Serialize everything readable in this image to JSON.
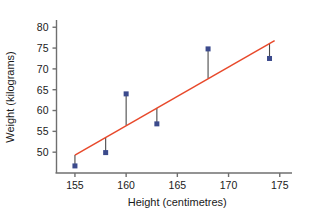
{
  "chart_data": {
    "type": "scatter",
    "title": "",
    "xlabel": "Height (centimetres)",
    "ylabel": "Weight (kilograms)",
    "xlim": [
      153.2,
      176.0
    ],
    "ylim": [
      45.0,
      81.5
    ],
    "xticks": [
      155,
      160,
      165,
      170,
      175
    ],
    "yticks": [
      50,
      55,
      60,
      65,
      70,
      75,
      80
    ],
    "xticklabels": [
      "155",
      "160",
      "165",
      "170",
      "175"
    ],
    "yticklabels": [
      "50",
      "55",
      "60",
      "65",
      "70",
      "75",
      "80"
    ],
    "grid": false,
    "legend": false,
    "point_color": "#3b4a8c",
    "line_color": "#e8492b",
    "residual_color": "#4a4a4a",
    "axis_color": "#6f6f6f",
    "series": [
      {
        "name": "Observations",
        "marker": "square",
        "x": [
          155,
          158,
          160,
          163,
          168,
          174
        ],
        "y": [
          46.7,
          49.9,
          64.0,
          56.8,
          74.8,
          72.5
        ]
      }
    ],
    "trend_line": {
      "name": "Least squares regression line",
      "x": [
        155,
        174.5
      ],
      "y": [
        49.3,
        76.8
      ],
      "slope": 1.41,
      "intercept": -169.2
    },
    "residual_segments": [
      {
        "x": 155,
        "y_point": 46.7,
        "y_line": 49.3
      },
      {
        "x": 158,
        "y_point": 49.9,
        "y_line": 53.5
      },
      {
        "x": 160,
        "y_point": 64.0,
        "y_line": 56.4
      },
      {
        "x": 163,
        "y_point": 56.8,
        "y_line": 60.6
      },
      {
        "x": 168,
        "y_point": 74.8,
        "y_line": 67.7
      },
      {
        "x": 174,
        "y_point": 72.5,
        "y_line": 76.2
      }
    ]
  }
}
